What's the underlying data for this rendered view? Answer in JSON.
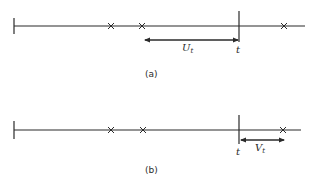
{
  "panels": [
    {
      "caption": "(a)",
      "arrow_label": "U",
      "arrow_sub": "t",
      "time_label": "t",
      "direction": "backward"
    },
    {
      "caption": "(b)",
      "arrow_label": "V",
      "arrow_sub": "t",
      "time_label": "t",
      "direction": "forward"
    }
  ],
  "event_marker": "×",
  "colors": {
    "ink": "#2a2a2a",
    "background": "#ffffff"
  }
}
